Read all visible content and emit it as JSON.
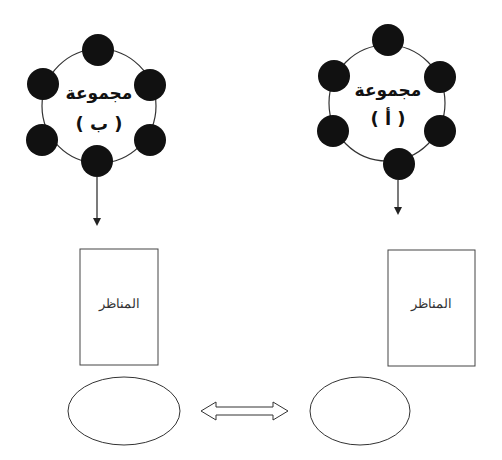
{
  "diagram": {
    "groups": [
      {
        "id": "group-b",
        "title": "مجموعة",
        "label": "( ب )",
        "node_count": 6,
        "box_label": "المناظر"
      },
      {
        "id": "group-a",
        "title": "مجموعة",
        "label": "( أ )",
        "node_count": 6,
        "box_label": "المناظر"
      }
    ],
    "connector": "double-arrow",
    "colors": {
      "node_fill": "#111111",
      "stroke": "#333333",
      "background": "#ffffff"
    }
  }
}
